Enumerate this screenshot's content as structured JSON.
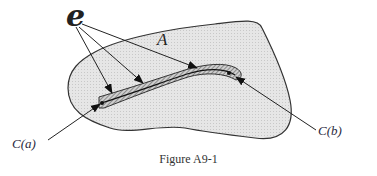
{
  "figure": {
    "caption": "Figure A9-1",
    "labels": {
      "curve_family": "e",
      "region": "A",
      "start_point": "C(a)",
      "end_point": "C(b)"
    },
    "colors": {
      "region_fill": "#e4e4e4",
      "strip_fill": "#bdbdbd",
      "stroke": "#333333",
      "background": "#ffffff"
    }
  }
}
